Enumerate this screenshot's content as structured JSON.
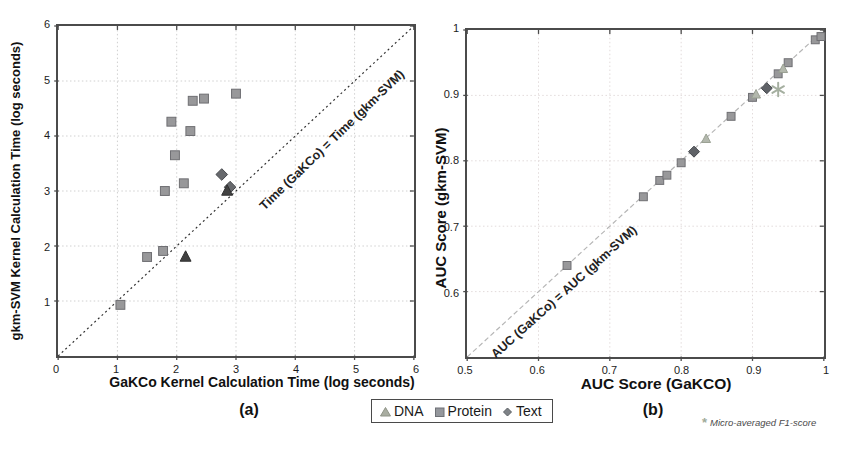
{
  "figure": {
    "footnote": {
      "marker": "*",
      "text": "Micro-averaged F1-score"
    }
  },
  "legend": {
    "items": [
      {
        "label": "DNA",
        "marker": "triangle",
        "color": "#a9ada1",
        "edge": "#8f9487"
      },
      {
        "label": "Protein",
        "marker": "square",
        "color": "#94979c",
        "edge": "#6e7176"
      },
      {
        "label": "Text",
        "marker": "diamond",
        "color": "#7e8287",
        "edge": "#5c6065"
      }
    ]
  },
  "chart_data": [
    {
      "id": "a",
      "type": "scatter",
      "caption": "(a)",
      "xlabel": "GaKCo Kernel Calculation Time (log seconds)",
      "ylabel": "gkm-SVM Kernel Calculation Time (log seconds)",
      "xlim": [
        0,
        6
      ],
      "ylim": [
        0,
        6
      ],
      "xticks": [
        "0",
        "1",
        "2",
        "3",
        "4",
        "5",
        "6"
      ],
      "yticks": [
        "1",
        "2",
        "3",
        "4",
        "5",
        "6"
      ],
      "grid": true,
      "grid_color": "#cfcfcf",
      "diagonal": {
        "from": [
          0,
          0
        ],
        "to": [
          6,
          6
        ],
        "color": "#2f2f2f",
        "dash": "2 3"
      },
      "diagonal_label": "Time (GaKCo) = Time (gkm-SVM)",
      "series": [
        {
          "name": "Protein",
          "marker": "square",
          "color": "#98989a",
          "edge": "#6e6e72",
          "size": 9,
          "points": [
            [
              1.05,
              0.93
            ],
            [
              1.5,
              1.8
            ],
            [
              1.77,
              1.91
            ],
            [
              1.8,
              3.0
            ],
            [
              2.12,
              3.14
            ],
            [
              1.97,
              3.65
            ],
            [
              2.23,
              4.09
            ],
            [
              1.91,
              4.26
            ],
            [
              2.27,
              4.64
            ],
            [
              2.46,
              4.68
            ],
            [
              3.0,
              4.77
            ]
          ]
        },
        {
          "name": "Text",
          "marker": "diamond",
          "color": "#66686c",
          "edge": "#46484c",
          "size": 9.5,
          "points": [
            [
              2.76,
              3.3
            ],
            [
              2.9,
              3.07
            ]
          ]
        },
        {
          "name": "DNA",
          "marker": "triangle",
          "color": "#414141",
          "edge": "#2f2f2f",
          "size": 11,
          "points": [
            [
              2.15,
              1.8
            ],
            [
              2.85,
              3.0
            ]
          ]
        }
      ]
    },
    {
      "id": "b",
      "type": "scatter",
      "caption": "(b)",
      "xlabel": "AUC Score (GaKCO)",
      "ylabel": "AUC Score (gkm-SVM)",
      "xlim": [
        0.5,
        1
      ],
      "ylim": [
        0.5,
        1
      ],
      "xticks": [
        "0.5",
        "0.6",
        "0.7",
        "0.8",
        "0.9",
        "1"
      ],
      "yticks": [
        "0.6",
        "0.7",
        "0.8",
        "0.9",
        "1"
      ],
      "grid": true,
      "grid_color": "#e2dada",
      "diagonal": {
        "from": [
          0.5,
          0.5
        ],
        "to": [
          1,
          1
        ],
        "color": "#b6b6b6",
        "dash": "5 3"
      },
      "diagonal_label": "AUC (GaKCo) = AUC (gkm-SVM)",
      "series": [
        {
          "name": "Protein",
          "marker": "square",
          "color": "#98989a",
          "edge": "#6e6e72",
          "size": 8,
          "points": [
            [
              0.64,
              0.64
            ],
            [
              0.747,
              0.745
            ],
            [
              0.77,
              0.77
            ],
            [
              0.78,
              0.778
            ],
            [
              0.8,
              0.797
            ],
            [
              0.87,
              0.868
            ],
            [
              0.9,
              0.897
            ],
            [
              0.936,
              0.933
            ],
            [
              0.95,
              0.95
            ],
            [
              0.988,
              0.985
            ],
            [
              0.996,
              0.99
            ]
          ]
        },
        {
          "name": "DNA",
          "marker": "triangle",
          "color": "#b3b8ad",
          "edge": "#99a092",
          "size": 9,
          "points": [
            [
              0.835,
              0.833
            ],
            [
              0.905,
              0.901
            ],
            [
              0.943,
              0.94
            ]
          ]
        },
        {
          "name": "Text",
          "marker": "diamond",
          "color": "#5f6267",
          "edge": "#44474c",
          "size": 9,
          "points": [
            [
              0.818,
              0.814
            ],
            [
              0.92,
              0.911
            ]
          ]
        },
        {
          "name": "F1",
          "marker": "asterisk",
          "color": "#a5afa0",
          "size": 13,
          "points": [
            [
              0.936,
              0.909
            ]
          ]
        }
      ]
    }
  ]
}
